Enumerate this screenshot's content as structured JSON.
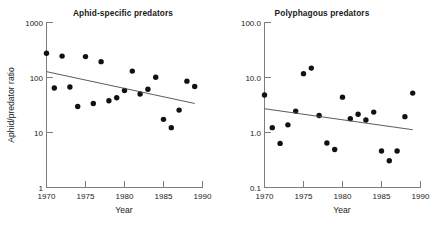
{
  "figure": {
    "background": "#ffffff",
    "marker_color": "#111111",
    "axis_color": "#7d7d7d",
    "trendline_color": "#4a4a4a"
  },
  "chart_data": [
    {
      "type": "scatter",
      "title": "Aphid-specific predators",
      "xlabel": "Year",
      "ylabel": "Aphid/predator ratio",
      "yscale": "log",
      "xlim": [
        1970,
        1990
      ],
      "ylim": [
        1,
        1000
      ],
      "grid": false,
      "legend": "none",
      "xticks": [
        1970,
        1975,
        1980,
        1985,
        1990
      ],
      "xticklabels": [
        "1970",
        "1975",
        "1980",
        "1985",
        "1990"
      ],
      "yticks": [
        1,
        10,
        100,
        1000
      ],
      "yticklabels": [
        "1",
        "10",
        "100",
        "1000"
      ],
      "x": [
        1970,
        1971,
        1972,
        1973,
        1974,
        1975,
        1976,
        1977,
        1978,
        1979,
        1980,
        1981,
        1982,
        1983,
        1984,
        1985,
        1986,
        1987,
        1988,
        1989
      ],
      "y": [
        270,
        63,
        240,
        66,
        29,
        235,
        33,
        190,
        37,
        42,
        57,
        128,
        49,
        60,
        99,
        17,
        12,
        25,
        84,
        67
      ],
      "trendline": {
        "x": [
          1970,
          1989
        ],
        "y": [
          125,
          33
        ],
        "note": "declining least-squares fit on log scale"
      }
    },
    {
      "type": "scatter",
      "title": "Polyphagous predators",
      "xlabel": "Year",
      "ylabel": "",
      "yscale": "log",
      "xlim": [
        1970,
        1990
      ],
      "ylim": [
        0.1,
        100.0
      ],
      "grid": false,
      "legend": "none",
      "xticks": [
        1970,
        1975,
        1980,
        1985,
        1990
      ],
      "xticklabels": [
        "1970",
        "1975",
        "1980",
        "1985",
        "1990"
      ],
      "yticks": [
        0.1,
        1.0,
        10.0,
        100.0
      ],
      "yticklabels": [
        "0.1",
        "1.0",
        "10.0",
        "100.0"
      ],
      "x": [
        1970,
        1971,
        1972,
        1973,
        1974,
        1975,
        1976,
        1977,
        1978,
        1979,
        1980,
        1981,
        1982,
        1983,
        1984,
        1985,
        1986,
        1987,
        1988,
        1989
      ],
      "y": [
        4.7,
        1.2,
        0.62,
        1.35,
        2.4,
        11.5,
        14.5,
        2.0,
        0.63,
        0.48,
        4.3,
        1.75,
        2.1,
        1.65,
        2.3,
        0.45,
        0.3,
        0.45,
        1.9,
        5.1
      ],
      "trendline": {
        "x": [
          1970,
          1989
        ],
        "y": [
          2.65,
          1.1
        ],
        "note": "declining least-squares fit on log scale"
      }
    }
  ]
}
